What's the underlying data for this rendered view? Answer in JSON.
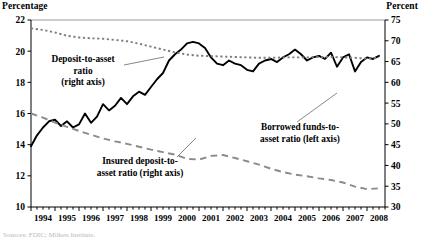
{
  "left_axis_title": "Percentage",
  "right_axis_title": "Percent",
  "source_note": "Sources: FDIC; Milken Institute.",
  "annotations": {
    "deposit": [
      "Deposit-to-asset",
      "ratio",
      "(right axis)"
    ],
    "insured": [
      "Insured deposit-to-",
      "asset ratio (right axis)"
    ],
    "borrowed": [
      "Borrowed funds-to-",
      "asset ratio (left axis)"
    ]
  },
  "chart_data": {
    "type": "line",
    "title": "",
    "xlabel": "",
    "ylabel": "Percentage",
    "y2label": "Percent",
    "grid": false,
    "legend": "annotations-inline",
    "xlim": [
      1994,
      2008.75
    ],
    "ylim": [
      10,
      22
    ],
    "y2lim": [
      30,
      75
    ],
    "yticks": [
      10,
      12,
      14,
      16,
      18,
      20,
      22
    ],
    "y2ticks": [
      30,
      35,
      40,
      45,
      50,
      55,
      60,
      65,
      70,
      75
    ],
    "xticks": [
      1994,
      1995,
      1996,
      1997,
      1998,
      1999,
      2000,
      2001,
      2002,
      2003,
      2004,
      2005,
      2006,
      2007,
      2008
    ],
    "minor_ticks_per_year": 4,
    "series": [
      {
        "name": "Borrowed funds-to-asset ratio (left axis)",
        "axis": "left",
        "style": "solid",
        "x": [
          1994.0,
          1994.25,
          1994.5,
          1994.75,
          1995.0,
          1995.25,
          1995.5,
          1995.75,
          1996.0,
          1996.25,
          1996.5,
          1996.75,
          1997.0,
          1997.25,
          1997.5,
          1997.75,
          1998.0,
          1998.25,
          1998.5,
          1998.75,
          1999.0,
          1999.25,
          1999.5,
          1999.75,
          2000.0,
          2000.25,
          2000.5,
          2000.75,
          2001.0,
          2001.25,
          2001.5,
          2001.75,
          2002.0,
          2002.25,
          2002.5,
          2002.75,
          2003.0,
          2003.25,
          2003.5,
          2003.75,
          2004.0,
          2004.25,
          2004.5,
          2004.75,
          2005.0,
          2005.25,
          2005.5,
          2005.75,
          2006.0,
          2006.25,
          2006.5,
          2006.75,
          2007.0,
          2007.25,
          2007.5,
          2007.75,
          2008.0,
          2008.25,
          2008.5
        ],
        "y": [
          13.9,
          14.6,
          15.1,
          15.5,
          15.6,
          15.2,
          15.5,
          15.1,
          15.3,
          16.0,
          15.4,
          15.8,
          16.6,
          16.2,
          16.5,
          17.0,
          16.6,
          17.1,
          17.4,
          17.2,
          17.7,
          18.2,
          18.6,
          19.4,
          19.8,
          20.1,
          20.5,
          20.6,
          20.5,
          20.2,
          19.6,
          19.2,
          19.1,
          19.4,
          19.2,
          19.1,
          18.8,
          18.7,
          19.2,
          19.4,
          19.5,
          19.3,
          19.6,
          19.8,
          20.1,
          19.8,
          19.4,
          19.6,
          19.7,
          19.5,
          19.9,
          19.0,
          19.6,
          19.8,
          18.7,
          19.3,
          19.6,
          19.5,
          19.7
        ]
      },
      {
        "name": "Deposit-to-asset ratio (right axis)",
        "axis": "right",
        "style": "dotted",
        "x": [
          1994.0,
          1994.5,
          1995.0,
          1995.5,
          1996.0,
          1996.5,
          1997.0,
          1997.5,
          1998.0,
          1998.5,
          1999.0,
          1999.5,
          2000.0,
          2000.5,
          2001.0,
          2001.5,
          2002.0,
          2002.5,
          2003.0,
          2003.5,
          2004.0,
          2004.5,
          2005.0,
          2005.5,
          2006.0,
          2006.5,
          2007.0,
          2007.5,
          2008.0,
          2008.5
        ],
        "y": [
          73.0,
          72.6,
          72.0,
          71.2,
          70.8,
          70.6,
          70.5,
          70.2,
          69.9,
          69.3,
          68.6,
          67.9,
          67.2,
          66.7,
          66.4,
          66.3,
          66.2,
          66.1,
          66.0,
          65.9,
          65.9,
          66.0,
          66.0,
          66.0,
          66.1,
          66.1,
          66.0,
          65.9,
          65.7,
          66.0
        ]
      },
      {
        "name": "Insured deposit-to-asset ratio (right axis)",
        "axis": "right",
        "style": "dashed",
        "x": [
          1994.0,
          1994.5,
          1995.0,
          1995.5,
          1996.0,
          1996.5,
          1997.0,
          1997.5,
          1998.0,
          1998.5,
          1999.0,
          1999.5,
          2000.0,
          2000.5,
          2001.0,
          2001.5,
          2002.0,
          2002.5,
          2003.0,
          2003.5,
          2004.0,
          2004.5,
          2005.0,
          2005.5,
          2006.0,
          2006.5,
          2007.0,
          2007.5,
          2008.0,
          2008.5
        ],
        "y": [
          52.5,
          51.5,
          50.3,
          49.3,
          48.3,
          47.4,
          46.5,
          45.8,
          45.2,
          44.5,
          43.8,
          43.2,
          42.6,
          41.6,
          41.4,
          42.3,
          42.5,
          41.8,
          41.0,
          40.2,
          39.2,
          38.4,
          37.8,
          37.4,
          36.9,
          36.5,
          35.9,
          34.9,
          34.3,
          34.5
        ]
      }
    ]
  }
}
